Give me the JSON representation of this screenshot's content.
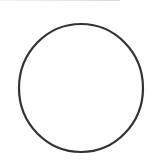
{
  "canvas": {
    "width": 159,
    "height": 168,
    "background": "#ffffff"
  },
  "shape": {
    "type": "circle",
    "cx": 81,
    "cy": 88,
    "rx": 62,
    "ry": 64,
    "stroke": "#333333",
    "stroke_width": 2.2,
    "fill": "none"
  }
}
